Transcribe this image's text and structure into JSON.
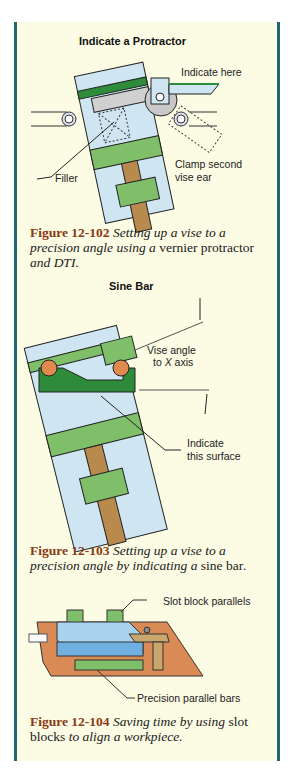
{
  "figures": [
    {
      "title": "Indicate a Protractor",
      "labels": {
        "indicate_here": "Indicate here",
        "filler": "Filler",
        "clamp_line1": "Clamp second",
        "clamp_line2": "vise ear"
      },
      "caption": {
        "number": "Figure 12-102",
        "part1": " Setting up a vise to a precision angle using a ",
        "part2": "vernier protractor",
        "part3": " and DTI."
      }
    },
    {
      "title": "Sine Bar",
      "labels": {
        "vise_angle_line1": "Vise angle",
        "vise_angle_line2_pre": "to ",
        "vise_angle_axis": "X",
        "vise_angle_line2_post": " axis",
        "indicate_line1": "Indicate",
        "indicate_line2": "this surface"
      },
      "caption": {
        "number": "Figure 12-103",
        "part1": " Setting up a vise to a precision angle by indicating a ",
        "part2": "sine bar",
        "part3": "."
      }
    },
    {
      "title": "",
      "labels": {
        "slot_block": "Slot block parallels",
        "parallel_bars": "Precision parallel bars"
      },
      "caption": {
        "number": "Figure 12-104",
        "part1": " Saving time by using ",
        "part2": "slot blocks",
        "part3": " to align a workpiece."
      }
    }
  ],
  "colors": {
    "panel_bg": "#fcfbe4",
    "border": "#1f6670",
    "caption_number": "#8a3a14",
    "vise_blue": "#cfe6f2",
    "green_light": "#7fbf6a",
    "green_dark": "#2e8b3a",
    "screw_brown": "#b98a4e",
    "ball_orange": "#e08a4e",
    "table_orange": "#d98a55"
  }
}
